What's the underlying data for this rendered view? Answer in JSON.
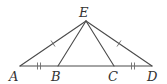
{
  "diagram": {
    "type": "geometry-triangle",
    "colors": {
      "line": "#4a4a4a",
      "label": "#333333",
      "tick": "#6a6a6a",
      "background": "#ffffff"
    },
    "points": [
      {
        "name": "A",
        "x": 20,
        "y": 66,
        "label_x": 9,
        "label_y": 81
      },
      {
        "name": "B",
        "x": 58,
        "y": 66,
        "label_x": 51,
        "label_y": 81
      },
      {
        "name": "C",
        "x": 114,
        "y": 66,
        "label_x": 108,
        "label_y": 81
      },
      {
        "name": "D",
        "x": 152,
        "y": 66,
        "label_x": 147,
        "label_y": 81
      },
      {
        "name": "E",
        "x": 86,
        "y": 21,
        "label_x": 79,
        "label_y": 17
      }
    ],
    "segments": [
      "AD",
      "AE",
      "BE",
      "CE",
      "DE"
    ],
    "congruence_marks": [
      {
        "segment": "AE",
        "ticks": 1
      },
      {
        "segment": "DE",
        "ticks": 1
      },
      {
        "segment": "AB",
        "ticks": 2
      },
      {
        "segment": "CD",
        "ticks": 2
      }
    ],
    "labels": {
      "A": "A",
      "B": "B",
      "C": "C",
      "D": "D",
      "E": "E"
    }
  }
}
